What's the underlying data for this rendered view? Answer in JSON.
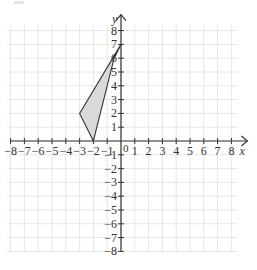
{
  "chart_data": {
    "type": "scatter",
    "title": "",
    "xlabel": "x",
    "ylabel": "y",
    "xlim": [
      -8,
      8
    ],
    "ylim": [
      -8,
      8
    ],
    "grid": true,
    "x_ticks": [
      -8,
      -7,
      -6,
      -5,
      -4,
      -3,
      -2,
      -1,
      1,
      2,
      3,
      4,
      5,
      6,
      7,
      8
    ],
    "y_ticks": [
      -8,
      -7,
      -6,
      -5,
      -4,
      -3,
      -2,
      -1,
      1,
      2,
      3,
      4,
      5,
      6,
      7,
      8
    ],
    "origin_label": "0",
    "shapes": [
      {
        "name": "shaded-quadrilateral",
        "vertices": [
          [
            0,
            7
          ],
          [
            -3,
            2
          ],
          [
            -2,
            0
          ],
          [
            -0.5,
            6
          ]
        ],
        "fill": "#d9d9d9",
        "stroke": "#333333"
      }
    ]
  },
  "style": {
    "grid_color": "#e6e6e6",
    "axis_color": "#333333",
    "text_color": "#333333"
  }
}
